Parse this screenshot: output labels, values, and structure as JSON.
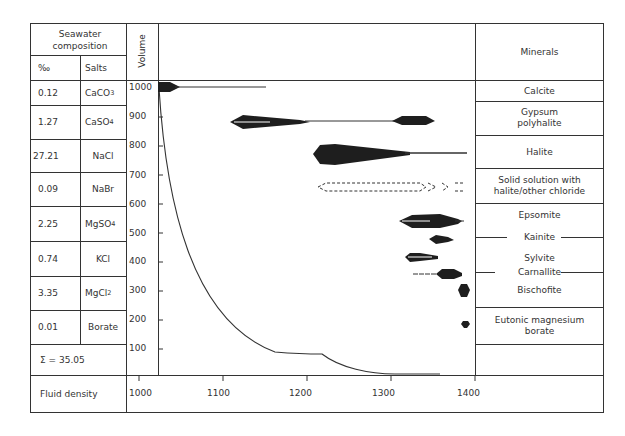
{
  "header": {
    "seawater_composition": "Seawater composition",
    "permil_header": "‰",
    "salts_header": "Salts",
    "volume_header": "Volume",
    "minerals_header": "Minerals"
  },
  "salts": [
    {
      "permil": "0.12",
      "salt": "CaCO",
      "sub": "3"
    },
    {
      "permil": "1.27",
      "salt": "CaSO",
      "sub": "4"
    },
    {
      "permil": "27.21",
      "salt": "NaCl",
      "sub": ""
    },
    {
      "permil": "0.09",
      "salt": "NaBr",
      "sub": ""
    },
    {
      "permil": "2.25",
      "salt": "MgSO",
      "sub": "4"
    },
    {
      "permil": "0.74",
      "salt": "KCl",
      "sub": ""
    },
    {
      "permil": "3.35",
      "salt": "MgCl",
      "sub": "2"
    },
    {
      "permil": "0.01",
      "salt": "Borate",
      "sub": ""
    }
  ],
  "sum_label": "Σ = 35.05",
  "fluid_density_label": "Fluid density",
  "volume_ticks": [
    "1000",
    "900",
    "800",
    "700",
    "600",
    "500",
    "400",
    "300",
    "200",
    "100"
  ],
  "density_ticks": [
    "1000",
    "1100",
    "1200",
    "1300",
    "1400"
  ],
  "minerals": [
    "Calcite",
    "Gypsum\npolyhalite",
    "Halite",
    "Solid solution with\nhalite/other chloride",
    "Epsomite",
    "Kainite",
    "Sylvite",
    "Carnallite",
    "Bischofite",
    "Eutonic magnesium\nborate"
  ],
  "colors": {
    "line": "#333333",
    "fill": "#1e1e1e",
    "text": "#333333"
  }
}
